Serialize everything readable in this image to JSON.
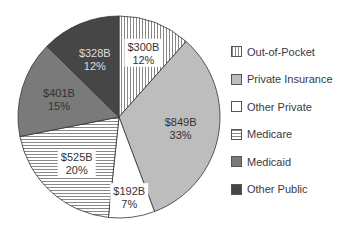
{
  "chart_data": {
    "type": "pie",
    "title": "",
    "categories": [
      "Out-of-Pocket",
      "Private Insurance",
      "Other Private",
      "Medicare",
      "Medicaid",
      "Other Public"
    ],
    "values": [
      300,
      849,
      192,
      525,
      401,
      328
    ],
    "value_labels": [
      "$300B",
      "$849B",
      "$192B",
      "$525B",
      "$401B",
      "$328B"
    ],
    "percent_labels": [
      "12%",
      "33%",
      "7%",
      "20%",
      "15%",
      "12%"
    ],
    "units": "billions USD",
    "fills": [
      "vertical-stripes",
      "#bdbdbd",
      "#ffffff",
      "horizontal-stripes",
      "#7a7a7a",
      "#464646"
    ],
    "legend_position": "right",
    "start_angle_deg": 0,
    "direction": "clockwise"
  },
  "legend": {
    "items": [
      {
        "label": "Out-of-Pocket",
        "swatch": "vertical-stripes"
      },
      {
        "label": "Private Insurance",
        "swatch": "#bdbdbd"
      },
      {
        "label": "Other Private",
        "swatch": "#ffffff"
      },
      {
        "label": "Medicare",
        "swatch": "horizontal-stripes"
      },
      {
        "label": "Medicaid",
        "swatch": "#7a7a7a"
      },
      {
        "label": "Other Public",
        "swatch": "#464646"
      }
    ]
  }
}
